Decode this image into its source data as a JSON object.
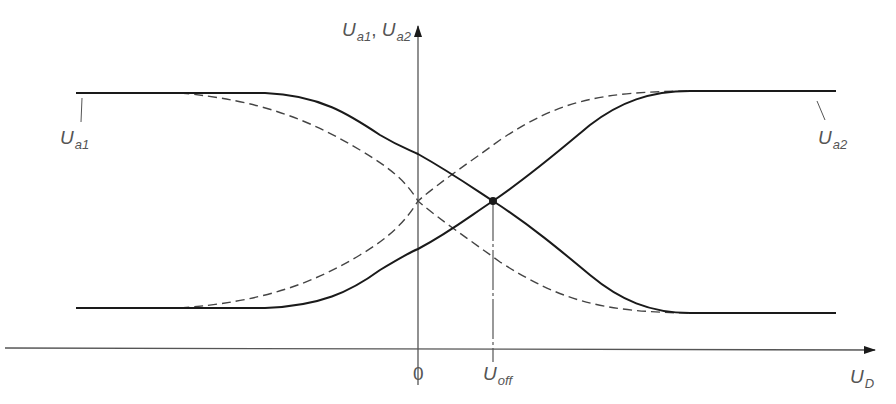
{
  "diagram": {
    "y_axis_label": {
      "main": "U",
      "sub1": "a1",
      "sep": ",",
      "main2": "U",
      "sub2": "a2"
    },
    "x_axis_label": {
      "main": "U",
      "sub": "D"
    },
    "origin_label": "0",
    "offset_label": {
      "main": "U",
      "sub": "off"
    },
    "curve_labels": {
      "ua1": {
        "main": "U",
        "sub": "a1"
      },
      "ua2": {
        "main": "U",
        "sub": "a2"
      }
    },
    "colors": {
      "curve": "#1a1a1a",
      "axis": "#555555",
      "dashed": "#444444",
      "text": "#555555"
    }
  }
}
